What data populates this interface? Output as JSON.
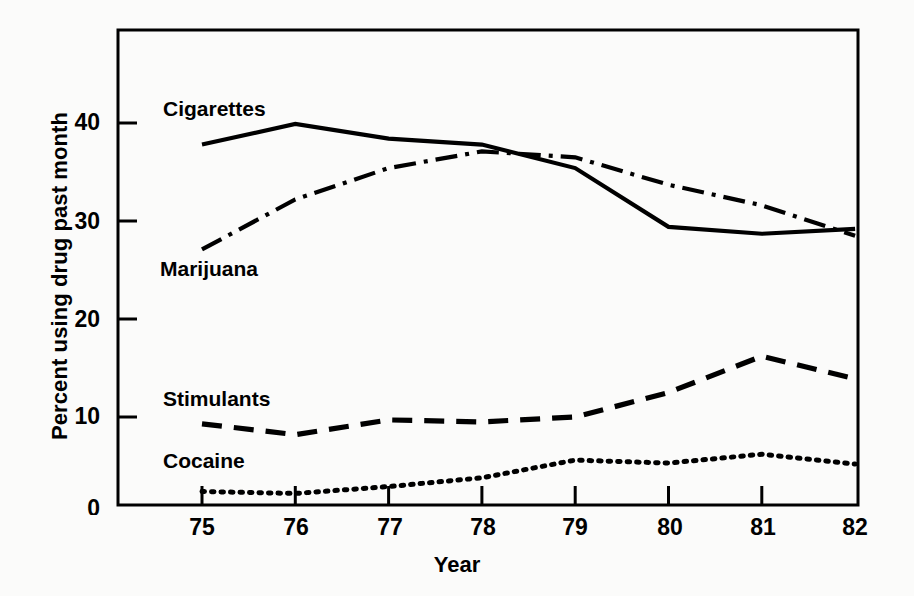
{
  "chart_data": {
    "type": "line",
    "title": "",
    "xlabel": "Year",
    "ylabel": "Percent using drug past month",
    "categories": [
      "75",
      "76",
      "77",
      "78",
      "79",
      "80",
      "81",
      "82"
    ],
    "x": [
      75,
      76,
      77,
      78,
      79,
      80,
      81,
      82
    ],
    "xlim": [
      74.4,
      82.4
    ],
    "ylim": [
      0,
      49
    ],
    "yticks": [
      0,
      10,
      20,
      30,
      40
    ],
    "ytick_labels": [
      "0",
      "10",
      "20",
      "30",
      "40"
    ],
    "xticks": [
      75,
      76,
      77,
      78,
      79,
      80,
      81,
      82
    ],
    "xtick_labels": [
      "75",
      "76",
      "77",
      "78",
      "79",
      "80",
      "81",
      "82"
    ],
    "grid": false,
    "legend_position": "inline-annotations",
    "series": [
      {
        "name": "Cigarettes",
        "style": "solid",
        "color": "#000000",
        "values": [
          37.8,
          39.9,
          38.4,
          37.8,
          35.4,
          29.4,
          28.7,
          29.2
        ]
      },
      {
        "name": "Marijuana",
        "style": "dash-dot",
        "color": "#000000",
        "values": [
          27.1,
          32.2,
          35.4,
          37.1,
          36.5,
          33.7,
          31.6,
          28.5
        ]
      },
      {
        "name": "Stimulants",
        "style": "dashed",
        "color": "#000000",
        "values": [
          9.3,
          8.2,
          9.7,
          9.5,
          10.0,
          12.5,
          16.2,
          13.9
        ]
      },
      {
        "name": "Cocaine",
        "style": "dotted",
        "color": "#000000",
        "values": [
          2.4,
          2.2,
          2.9,
          3.8,
          5.6,
          5.3,
          6.2,
          5.2
        ]
      }
    ],
    "annotations": [
      {
        "text": "Cigarettes",
        "x": 163,
        "y": 98
      },
      {
        "text": "Marijuana",
        "x": 160,
        "y": 258
      },
      {
        "text": "Stimulants",
        "x": 163,
        "y": 388
      },
      {
        "text": "Cocaine",
        "x": 163,
        "y": 450
      }
    ]
  },
  "axis": {
    "ytick_positions": [
      {
        "label": "40",
        "left": 40,
        "top": 111
      },
      {
        "label": "30",
        "left": 40,
        "top": 210
      },
      {
        "label": "20",
        "left": 40,
        "top": 308
      },
      {
        "label": "10",
        "left": 40,
        "top": 405
      },
      {
        "label": "0",
        "left": 40,
        "top": 497
      }
    ],
    "xtick_positions": [
      {
        "label": "75",
        "left": 172,
        "top": 516
      },
      {
        "label": "76",
        "left": 266,
        "top": 516
      },
      {
        "label": "77",
        "left": 360,
        "top": 516
      },
      {
        "label": "78",
        "left": 453,
        "top": 516
      },
      {
        "label": "79",
        "left": 545,
        "top": 516
      },
      {
        "label": "80",
        "left": 640,
        "top": 516
      },
      {
        "label": "81",
        "left": 733,
        "top": 516
      },
      {
        "label": "82",
        "left": 825,
        "top": 516
      }
    ]
  }
}
